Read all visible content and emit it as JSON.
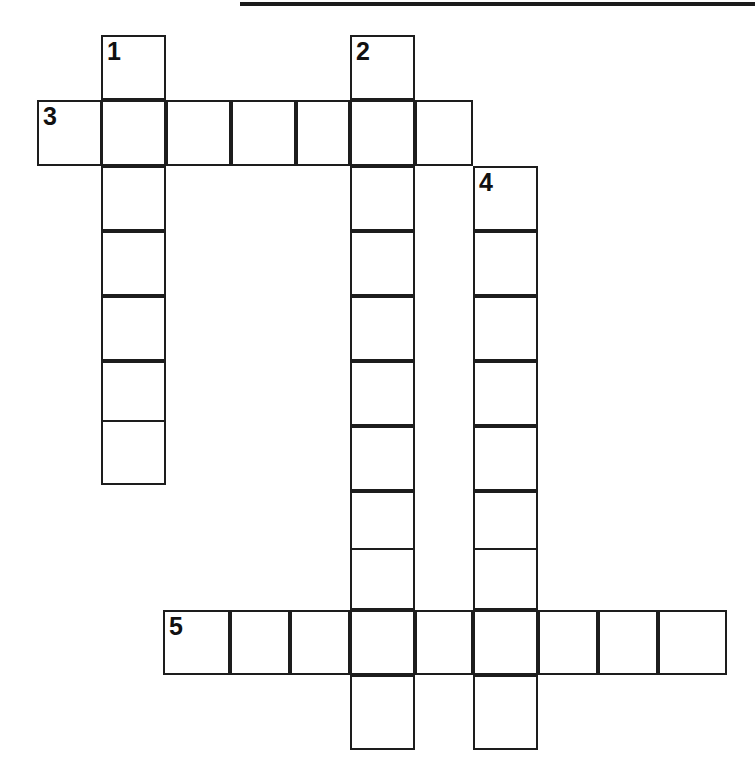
{
  "page": {
    "width": 755,
    "height": 772,
    "background": "#ffffff",
    "ink_color": "#1d1d1d"
  },
  "top_rule": {
    "name": "horizontal-rule",
    "x": 240,
    "y": 2,
    "width": 515,
    "height": 4
  },
  "puzzle": {
    "type": "crossword",
    "cell_size": 65,
    "numbered_clues": [
      "1",
      "2",
      "3",
      "4",
      "5"
    ],
    "entries": [
      {
        "number": "1",
        "direction": "down",
        "length": 7,
        "start_x": 101,
        "start_y": 35
      },
      {
        "number": "2",
        "direction": "down",
        "length": 11,
        "start_x": 350,
        "start_y": 35
      },
      {
        "number": "3",
        "direction": "across",
        "length": 7,
        "start_x": 37,
        "start_y": 100
      },
      {
        "number": "4",
        "direction": "down",
        "length": 9,
        "start_x": 473,
        "start_y": 166
      },
      {
        "number": "5",
        "direction": "across",
        "length": 9,
        "start_x": 163,
        "start_y": 610
      }
    ],
    "cells": [
      {
        "x": 101,
        "y": 35,
        "w": 65,
        "h": 65,
        "number": "1",
        "letter": ""
      },
      {
        "x": 350,
        "y": 35,
        "w": 65,
        "h": 65,
        "number": "2",
        "letter": ""
      },
      {
        "x": 37,
        "y": 100,
        "w": 65,
        "h": 66,
        "number": "3",
        "letter": ""
      },
      {
        "x": 101,
        "y": 100,
        "w": 65,
        "h": 66,
        "number": "",
        "letter": ""
      },
      {
        "x": 166,
        "y": 100,
        "w": 65,
        "h": 66,
        "number": "",
        "letter": ""
      },
      {
        "x": 231,
        "y": 100,
        "w": 65,
        "h": 66,
        "number": "",
        "letter": ""
      },
      {
        "x": 296,
        "y": 100,
        "w": 54,
        "h": 66,
        "number": "",
        "letter": ""
      },
      {
        "x": 350,
        "y": 100,
        "w": 65,
        "h": 66,
        "number": "",
        "letter": ""
      },
      {
        "x": 415,
        "y": 100,
        "w": 58,
        "h": 66,
        "number": "",
        "letter": ""
      },
      {
        "x": 101,
        "y": 166,
        "w": 65,
        "h": 65,
        "number": "",
        "letter": ""
      },
      {
        "x": 350,
        "y": 166,
        "w": 65,
        "h": 65,
        "number": "",
        "letter": ""
      },
      {
        "x": 473,
        "y": 166,
        "w": 65,
        "h": 65,
        "number": "4",
        "letter": ""
      },
      {
        "x": 101,
        "y": 231,
        "w": 65,
        "h": 65,
        "number": "",
        "letter": ""
      },
      {
        "x": 350,
        "y": 231,
        "w": 65,
        "h": 65,
        "number": "",
        "letter": ""
      },
      {
        "x": 473,
        "y": 231,
        "w": 65,
        "h": 65,
        "number": "",
        "letter": ""
      },
      {
        "x": 101,
        "y": 296,
        "w": 65,
        "h": 65,
        "number": "",
        "letter": ""
      },
      {
        "x": 350,
        "y": 296,
        "w": 65,
        "h": 65,
        "number": "",
        "letter": ""
      },
      {
        "x": 473,
        "y": 296,
        "w": 65,
        "h": 65,
        "number": "",
        "letter": ""
      },
      {
        "x": 101,
        "y": 361,
        "w": 65,
        "h": 65,
        "number": "",
        "letter": ""
      },
      {
        "x": 350,
        "y": 361,
        "w": 65,
        "h": 65,
        "number": "",
        "letter": ""
      },
      {
        "x": 473,
        "y": 361,
        "w": 65,
        "h": 65,
        "number": "",
        "letter": ""
      },
      {
        "x": 101,
        "y": 420,
        "w": 65,
        "h": 65,
        "number": "",
        "letter": ""
      },
      {
        "x": 350,
        "y": 426,
        "w": 65,
        "h": 65,
        "number": "",
        "letter": ""
      },
      {
        "x": 473,
        "y": 426,
        "w": 65,
        "h": 65,
        "number": "",
        "letter": ""
      },
      {
        "x": 350,
        "y": 491,
        "w": 65,
        "h": 65,
        "number": "",
        "letter": ""
      },
      {
        "x": 473,
        "y": 491,
        "w": 65,
        "h": 65,
        "number": "",
        "letter": ""
      },
      {
        "x": 350,
        "y": 548,
        "w": 65,
        "h": 62,
        "number": "",
        "letter": ""
      },
      {
        "x": 473,
        "y": 548,
        "w": 65,
        "h": 62,
        "number": "",
        "letter": ""
      },
      {
        "x": 163,
        "y": 610,
        "w": 67,
        "h": 65,
        "number": "5",
        "letter": ""
      },
      {
        "x": 230,
        "y": 610,
        "w": 60,
        "h": 65,
        "number": "",
        "letter": ""
      },
      {
        "x": 290,
        "y": 610,
        "w": 60,
        "h": 65,
        "number": "",
        "letter": ""
      },
      {
        "x": 350,
        "y": 610,
        "w": 65,
        "h": 65,
        "number": "",
        "letter": ""
      },
      {
        "x": 415,
        "y": 610,
        "w": 58,
        "h": 65,
        "number": "",
        "letter": ""
      },
      {
        "x": 473,
        "y": 610,
        "w": 65,
        "h": 65,
        "number": "",
        "letter": ""
      },
      {
        "x": 538,
        "y": 610,
        "w": 60,
        "h": 65,
        "number": "",
        "letter": ""
      },
      {
        "x": 598,
        "y": 610,
        "w": 60,
        "h": 65,
        "number": "",
        "letter": ""
      },
      {
        "x": 658,
        "y": 610,
        "w": 69,
        "h": 65,
        "number": "",
        "letter": ""
      },
      {
        "x": 350,
        "y": 675,
        "w": 65,
        "h": 75,
        "number": "",
        "letter": ""
      },
      {
        "x": 473,
        "y": 675,
        "w": 65,
        "h": 75,
        "number": "",
        "letter": ""
      }
    ]
  }
}
